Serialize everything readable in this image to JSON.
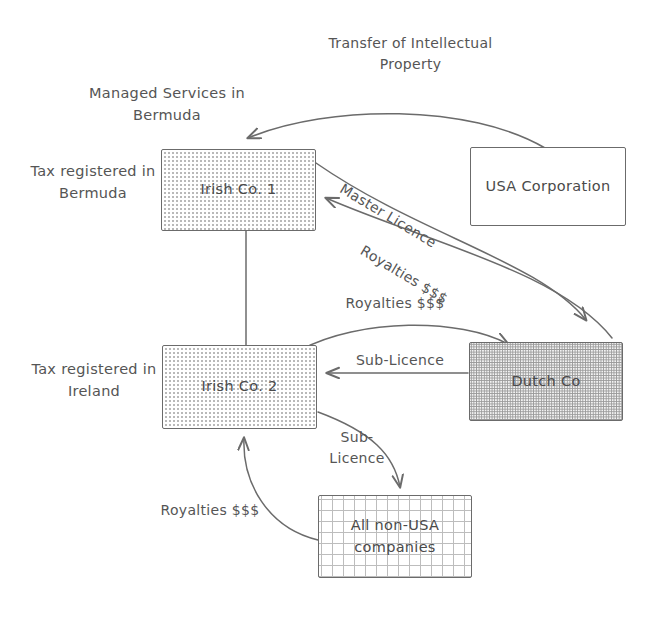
{
  "diagram": {
    "background": "#ffffff",
    "stroke_color": "#6b6b6b",
    "text_color": "#555555",
    "nodes": [
      {
        "id": "irish1",
        "label": "Irish Co. 1",
        "fill": "dots-light"
      },
      {
        "id": "usa",
        "label": "USA Corporation",
        "fill": "plain"
      },
      {
        "id": "irish2",
        "label": "Irish Co. 2",
        "fill": "dots-light"
      },
      {
        "id": "dutch",
        "label": "Dutch Co",
        "fill": "dots-dense"
      },
      {
        "id": "nonusa",
        "label": "All non-USA\ncompanies",
        "fill": "grid"
      }
    ],
    "annotations": [
      {
        "id": "managed-services",
        "text": "Managed Services in\nBermuda"
      },
      {
        "id": "tax-bermuda",
        "text": "Tax registered in\nBermuda"
      },
      {
        "id": "tax-ireland",
        "text": "Tax registered in\nIreland"
      }
    ],
    "edge_labels": [
      {
        "id": "transfer-ip",
        "text": "Transfer of Intellectual\nProperty",
        "from": "usa",
        "to": "irish1"
      },
      {
        "id": "master-licence",
        "text": "Master Licence",
        "from": "irish1",
        "to": "dutch"
      },
      {
        "id": "royalties-dutch-to-irish1",
        "text": "Royalties $$$",
        "from": "dutch",
        "to": "irish1"
      },
      {
        "id": "royalties-irish2-to-dutch",
        "text": "Royalties $$$",
        "from": "irish2",
        "to": "dutch"
      },
      {
        "id": "sub-licence-dutch-to-irish2",
        "text": "Sub-Licence",
        "from": "dutch",
        "to": "irish2"
      },
      {
        "id": "sub-licence-irish2-to-nonusa",
        "text": "Sub-\nLicence",
        "from": "irish2",
        "to": "nonusa"
      },
      {
        "id": "royalties-nonusa-to-irish2",
        "text": "Royalties $$$",
        "from": "nonusa",
        "to": "irish2"
      }
    ]
  }
}
